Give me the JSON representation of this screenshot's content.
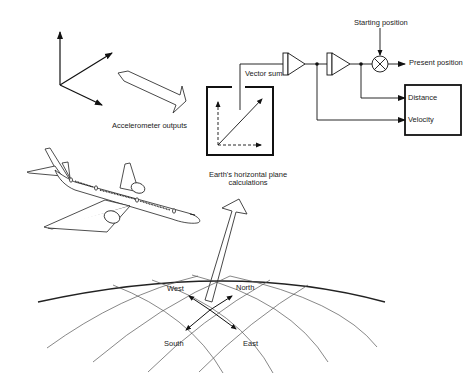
{
  "diagram": {
    "labels": {
      "accelerometer_outputs": "Accelerometer outputs",
      "vector_sum": "Vector sum",
      "starting_position": "Starting position",
      "present_position": "Present position",
      "distance": "Distance",
      "velocity": "Velocity",
      "earth_plane_line1": "Earth's horizontal plane",
      "earth_plane_line2": "calculations",
      "west": "West",
      "north": "North",
      "south": "South",
      "east": "East"
    },
    "components": [
      "accelerometer-axes",
      "accelerometer-output-arrow",
      "vector-sum-box",
      "integrator-1",
      "integrator-2",
      "summing-junction",
      "output-box",
      "airplane",
      "earth-plane-arrow",
      "earth-grid"
    ],
    "colors": {
      "line": "#111111",
      "grid": "#555555",
      "background": "#ffffff"
    }
  }
}
